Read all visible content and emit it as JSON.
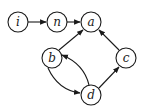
{
  "diagram": {
    "type": "directed-graph",
    "nodes": [
      {
        "id": "i",
        "label": "i",
        "x": 18,
        "y": 22
      },
      {
        "id": "n",
        "label": "n",
        "x": 57,
        "y": 22
      },
      {
        "id": "a",
        "label": "a",
        "x": 91,
        "y": 22
      },
      {
        "id": "b",
        "label": "b",
        "x": 52,
        "y": 58
      },
      {
        "id": "c",
        "label": "c",
        "x": 126,
        "y": 58
      },
      {
        "id": "d",
        "label": "d",
        "x": 91,
        "y": 95
      }
    ],
    "edges": [
      {
        "from": "i",
        "to": "n",
        "shape": "straight"
      },
      {
        "from": "n",
        "to": "a",
        "shape": "straight"
      },
      {
        "from": "b",
        "to": "a",
        "shape": "straight"
      },
      {
        "from": "c",
        "to": "a",
        "shape": "straight"
      },
      {
        "from": "d",
        "to": "c",
        "shape": "straight"
      },
      {
        "from": "b",
        "to": "d",
        "shape": "curved-left"
      },
      {
        "from": "d",
        "to": "b",
        "shape": "curved-right"
      }
    ],
    "colors": {
      "stroke": "#1a1a1a",
      "fill": "#ffffff"
    }
  }
}
